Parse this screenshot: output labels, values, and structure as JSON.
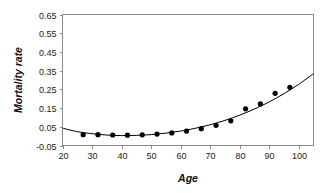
{
  "chart_data": {
    "type": "scatter",
    "title": "",
    "xlabel": "Age",
    "ylabel": "Mortality rate",
    "xlim": [
      20,
      105
    ],
    "ylim": [
      -0.05,
      0.65
    ],
    "grid": false,
    "legend": null,
    "x_ticks": [
      20,
      30,
      40,
      50,
      60,
      70,
      80,
      90,
      100
    ],
    "x_tick_labels": [
      "20",
      "30",
      "40",
      "50",
      "60",
      "70",
      "80",
      "90",
      "100"
    ],
    "y_ticks": [
      -0.05,
      0.05,
      0.15,
      0.25,
      0.35,
      0.45,
      0.55,
      0.65
    ],
    "y_tick_labels": [
      "-0.05",
      "0.05",
      "0.15",
      "0.25",
      "0.35",
      "0.45",
      "0.55",
      "0.65"
    ],
    "series": [
      {
        "name": "Observed mortality rate",
        "marker": "filled-circle",
        "color": "#000000",
        "x": [
          27,
          32,
          37,
          42,
          47,
          52,
          57,
          62,
          67,
          72,
          77,
          82,
          87,
          92,
          97
        ],
        "values": [
          0.008,
          0.008,
          0.006,
          0.005,
          0.007,
          0.011,
          0.017,
          0.027,
          0.04,
          0.058,
          0.082,
          0.146,
          0.172,
          0.229,
          0.261
        ]
      },
      {
        "name": "Fitted curve",
        "marker": "none",
        "color": "#000000",
        "x": [
          20,
          25,
          30,
          35,
          40,
          45,
          50,
          55,
          60,
          65,
          70,
          75,
          80,
          85,
          90,
          95,
          100,
          105
        ],
        "values": [
          0.043,
          0.024,
          0.013,
          0.006,
          0.003,
          0.004,
          0.008,
          0.016,
          0.027,
          0.042,
          0.061,
          0.084,
          0.112,
          0.145,
          0.183,
          0.227,
          0.277,
          0.334
        ]
      }
    ]
  }
}
